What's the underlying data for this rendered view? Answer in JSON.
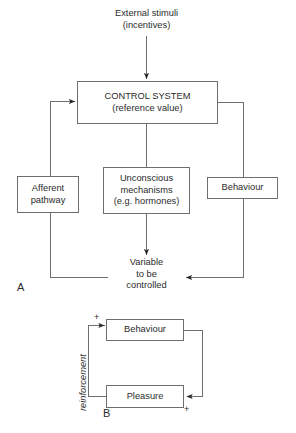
{
  "figure": {
    "title_a": "A",
    "title_b": "B"
  },
  "panel_a": {
    "external_stimuli": "External stimuli\n(incentives)",
    "control_system": "CONTROL SYSTEM\n(reference value)",
    "afferent_pathway": "Afferent\npathway",
    "unconscious_mechanisms": "Unconscious\nmechanisms\n(e.g. hormones)",
    "behaviour": "Behaviour",
    "variable": "Variable\nto be\ncontrolled"
  },
  "panel_b": {
    "behaviour": "Behaviour",
    "pleasure": "Pleasure",
    "reinforcement": "reinforcement",
    "plus_top": "+",
    "plus_bottom": "+"
  },
  "style": {
    "stroke": "#6e6e6e",
    "text": "#2b2b2b",
    "background": "#ffffff"
  }
}
